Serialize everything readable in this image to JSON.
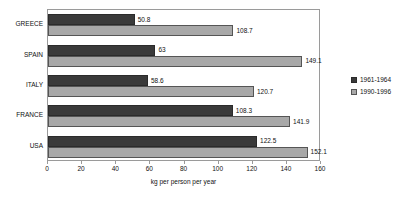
{
  "chart_data": {
    "type": "bar",
    "orientation": "horizontal",
    "title": "",
    "xlabel": "kg per person per year",
    "ylabel": "",
    "categories": [
      "GREECE",
      "SPAIN",
      "ITALY",
      "FRANCE",
      "USA"
    ],
    "series": [
      {
        "name": "1961-1964",
        "color": "#3a3a3a",
        "values": [
          50.8,
          63,
          58.6,
          108.3,
          122.5
        ],
        "labels": [
          "50.8",
          "63",
          "58.6",
          "108.3",
          "122.5"
        ]
      },
      {
        "name": "1990-1996",
        "color": "#a8a8a8",
        "values": [
          108.7,
          149.1,
          120.7,
          141.9,
          152.1
        ],
        "labels": [
          "108.7",
          "149.1",
          "120.7",
          "141.9",
          "152.1"
        ]
      }
    ],
    "xlim": [
      0,
      160
    ],
    "xticks": [
      0,
      20,
      40,
      60,
      80,
      100,
      120,
      140,
      160
    ],
    "xtick_labels": [
      "0",
      "20",
      "40",
      "60",
      "80",
      "100",
      "120",
      "140",
      "160"
    ],
    "grid": false,
    "legend_position": "right",
    "frame_color": "#9a9a9a"
  }
}
